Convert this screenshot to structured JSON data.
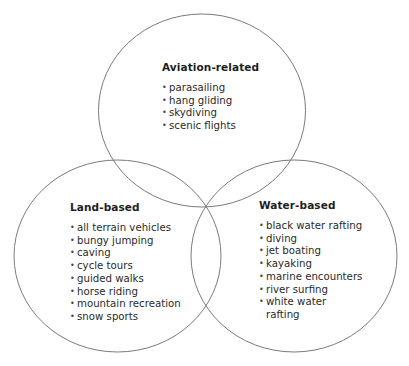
{
  "diagram": {
    "type": "venn",
    "stroke_color": "#7a7a7a",
    "sets": [
      {
        "id": "aviation",
        "title": "Aviation-related",
        "items": [
          "parasailing",
          "hang gliding",
          "skydiving",
          "scenic flights"
        ]
      },
      {
        "id": "land",
        "title": "Land-based",
        "items": [
          "all terrain vehicles",
          "bungy jumping",
          "caving",
          "cycle tours",
          "guided walks",
          "horse riding",
          "mountain recreation",
          "snow sports"
        ]
      },
      {
        "id": "water",
        "title": "Water-based",
        "items": [
          "black water rafting",
          "diving",
          "jet boating",
          "kayaking",
          "marine encounters",
          "river surfing",
          "white water rafting"
        ]
      }
    ]
  }
}
